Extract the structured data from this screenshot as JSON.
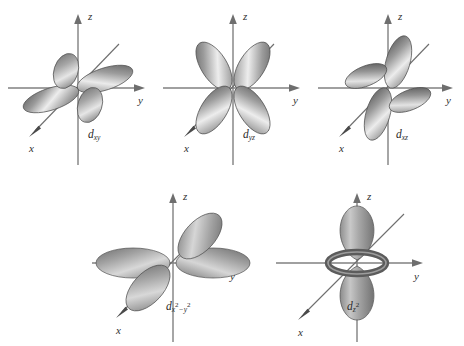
{
  "figure": {
    "title": "",
    "background_color": "#ffffff",
    "axis_color": "#808080",
    "axis_label_color": "#2f2f2f",
    "lobe_dark": "#555555",
    "lobe_mid": "#909090",
    "lobe_light": "#e8e8e8",
    "lobe_outline": "#4a4a4a",
    "rows": 2,
    "columns": 3
  },
  "axes": {
    "z_label": "z",
    "y_label": "y",
    "x_label": "x"
  },
  "orbitals": [
    {
      "id": "dxy",
      "label_d": "d",
      "label_sub": "xy",
      "label_sup1": "",
      "label_sup2": "",
      "lobe_count": 4,
      "plane": "xy",
      "description": "four lobes in the xy plane between the x and y axes"
    },
    {
      "id": "dyz",
      "label_d": "d",
      "label_sub": "yz",
      "label_sup1": "",
      "label_sup2": "",
      "lobe_count": 4,
      "plane": "yz",
      "description": "four lobes in the yz plane between the y and z axes"
    },
    {
      "id": "dxz",
      "label_d": "d",
      "label_sub": "xz",
      "label_sup1": "",
      "label_sup2": "",
      "lobe_count": 4,
      "plane": "xz",
      "description": "four lobes in the xz plane between the x and z axes"
    },
    {
      "id": "dx2-y2",
      "label_d": "d",
      "label_sub_x": "x",
      "label_sup1": "2",
      "label_minus": "−",
      "label_sub_y": "y",
      "label_sup2": "2",
      "lobe_count": 4,
      "plane": "xy",
      "description": "four lobes along the x and y axes"
    },
    {
      "id": "dz2",
      "label_d": "d",
      "label_sub": "z",
      "label_sup1": "2",
      "label_sup2": "",
      "lobe_count": 2,
      "plane": "z",
      "torus": true,
      "description": "two lobes along the z axis with a torus in the xy plane"
    }
  ]
}
